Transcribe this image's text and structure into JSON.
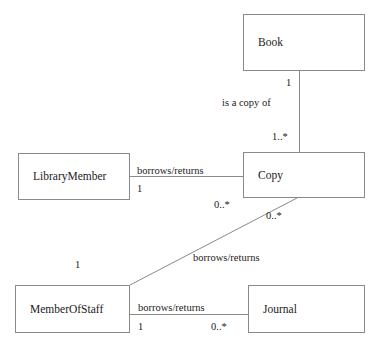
{
  "diagram": {
    "type": "uml-class-diagram",
    "background_color": "#ffffff",
    "line_color": "#8a8a8a",
    "text_color": "#1a1a1a",
    "classes": [
      {
        "id": "book",
        "name": "Book",
        "x": 243,
        "y": 14,
        "width": 122,
        "height": 57
      },
      {
        "id": "librarymember",
        "name": "LibraryMember",
        "x": 18,
        "y": 153,
        "width": 112,
        "height": 47
      },
      {
        "id": "copy",
        "name": "Copy",
        "x": 243,
        "y": 152,
        "width": 122,
        "height": 46
      },
      {
        "id": "memberofstaff",
        "name": "MemberOfStaff",
        "x": 15,
        "y": 285,
        "width": 115,
        "height": 48
      },
      {
        "id": "journal",
        "name": "Journal",
        "x": 248,
        "y": 285,
        "width": 117,
        "height": 48
      }
    ],
    "associations": [
      {
        "id": "book-copy",
        "label": "is a copy of",
        "from": "book",
        "to": "copy",
        "from_multiplicity": "1",
        "to_multiplicity": "1..*"
      },
      {
        "id": "librarymember-copy",
        "label": "borrows/returns",
        "from": "librarymember",
        "to": "copy",
        "from_multiplicity": "1",
        "to_multiplicity": "0..*"
      },
      {
        "id": "memberofstaff-copy",
        "label": "borrows/returns",
        "from": "memberofstaff",
        "to": "copy",
        "from_multiplicity": "1",
        "to_multiplicity": "0..*"
      },
      {
        "id": "memberofstaff-journal",
        "label": "borrows/returns",
        "from": "memberofstaff",
        "to": "journal",
        "from_multiplicity": "1",
        "to_multiplicity": "0..*"
      }
    ]
  }
}
